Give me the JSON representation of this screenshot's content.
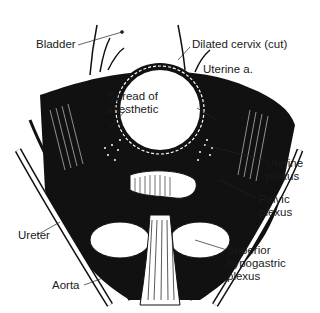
{
  "figure": {
    "type": "anatomical-illustration",
    "colors": {
      "ink": "#111111",
      "background": "#ffffff"
    }
  },
  "labels": {
    "bladder": "Bladder",
    "dilated_cervix": "Dilated cervix (cut)",
    "uterine_artery": "Uterine a.",
    "spread_line1": "Spread of",
    "spread_line2": "anesthetic",
    "uterine_plexus_line1": "Uterine",
    "uterine_plexus_line2": "plexus",
    "pelvic_plexus_line1": "Pelvic",
    "pelvic_plexus_line2": "plexus",
    "ureter": "Ureter",
    "superior_line1": "Superior",
    "superior_line2": "hypogastric",
    "superior_line3": "plexus",
    "aorta": "Aorta"
  }
}
